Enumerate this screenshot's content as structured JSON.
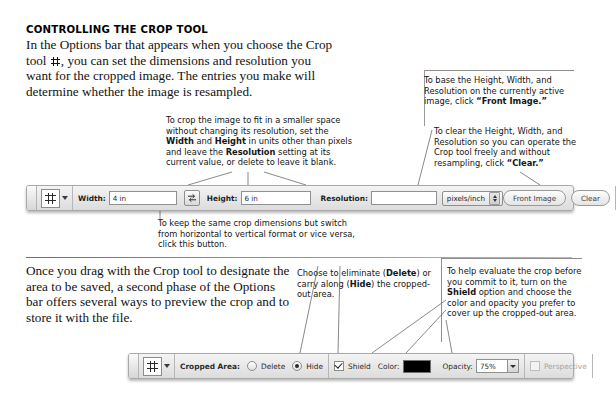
{
  "headline": "CONTROLLING THE CROP TOOL",
  "intro_paragraph": {
    "part1": "In the Options bar that appears when you choose the Crop tool ",
    "part2": ", you can set the dimensions and resolution you want for the cropped image. The entries you make will determine whether the image is resampled."
  },
  "second_paragraph": "Once you drag with the Crop tool to designate the area to be saved, a second phase of the Options bar offers several ways to preview the crop and to store it with the file.",
  "callouts": {
    "width_height": {
      "s1": "To crop the image to fit in a smaller space without changing its resolution, set the ",
      "b1": "Width",
      "s2": " and ",
      "b2": "Height",
      "s3": " in units other than pixels and leave the ",
      "b3": "Resolution",
      "s4": " setting at its current value, or delete to leave it blank."
    },
    "front_image": {
      "s1": "To base the Height, Width, and Resolution on the currently active image, click ",
      "b1": "“Front Image.”"
    },
    "clear": {
      "s1": "To clear the Height, Width, and Resolution so you can operate the Crop tool freely and without resampling, click ",
      "b1": "“Clear.”"
    },
    "rotate": {
      "s1": "To keep the same crop dimensions but switch from horizontal to vertical format or vice versa, click this button."
    },
    "delete_hide": {
      "s1": "Choose to eliminate (",
      "b1": "Delete",
      "s2": ") or carry along (",
      "b2": "Hide",
      "s3": ") the cropped-out area."
    },
    "shield": {
      "s1": "To help evaluate the crop before you commit to it, turn on the ",
      "b1": "Shield",
      "s2": " option and choose the color and opacity you prefer to cover up the cropped-out area."
    }
  },
  "options_bar_1": {
    "tool_icon": "crop-tool-icon",
    "tool_preset_caret": "chevron-down-icon",
    "width_label": "Width:",
    "width_value": "4 in",
    "swap_icon": "swap-width-height-icon",
    "height_label": "Height:",
    "height_value": "6 in",
    "resolution_label": "Resolution:",
    "resolution_value": "",
    "units_value": "pixels/inch",
    "front_image_label": "Front Image",
    "clear_label": "Clear"
  },
  "options_bar_2": {
    "tool_icon": "crop-tool-icon",
    "tool_preset_caret": "chevron-down-icon",
    "cropped_area_label": "Cropped Area:",
    "delete_label": "Delete",
    "delete_selected": false,
    "hide_label": "Hide",
    "hide_selected": true,
    "shield_label": "Shield",
    "shield_checked": true,
    "color_label": "Color:",
    "color_value": "#000000",
    "opacity_label": "Opacity:",
    "opacity_value": "75%",
    "perspective_label": "Perspective",
    "perspective_checked": false,
    "perspective_enabled": false
  }
}
